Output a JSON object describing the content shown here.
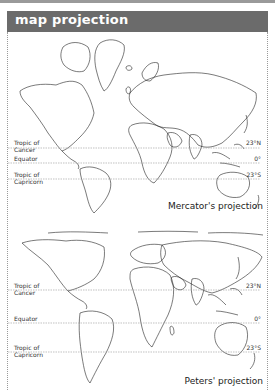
{
  "header": {
    "title": "map projection"
  },
  "mercator": {
    "caption": "Mercator's projection",
    "tropic_cancer_label": "Tropic of\nCancer",
    "equator_label": "Equator",
    "tropic_capricorn_label": "Tropic of\nCapricorn",
    "cancer_deg": "23°N",
    "equator_deg": "0°",
    "capricorn_deg": "23°S"
  },
  "peters": {
    "caption": "Peters' projection",
    "tropic_cancer_label": "Tropic of\nCancer",
    "equator_label": "Equator",
    "tropic_capricorn_label": "Tropic of\nCapricorn",
    "cancer_deg": "23°N",
    "equator_deg": "0°",
    "capricorn_deg": "23°S"
  }
}
